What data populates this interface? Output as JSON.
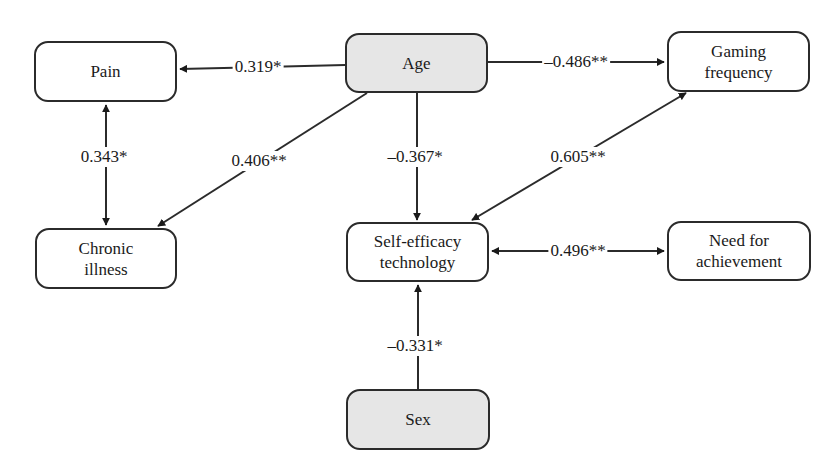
{
  "diagram": {
    "type": "path-diagram",
    "nodes": [
      {
        "id": "pain",
        "label": "Pain",
        "lines": [
          "Pain"
        ],
        "shaded": false
      },
      {
        "id": "age",
        "label": "Age",
        "lines": [
          "Age"
        ],
        "shaded": true
      },
      {
        "id": "gaming",
        "label": "Gaming frequency",
        "lines": [
          "Gaming",
          "frequency"
        ],
        "shaded": false
      },
      {
        "id": "chronic",
        "label": "Chronic illness",
        "lines": [
          "Chronic",
          "illness"
        ],
        "shaded": false
      },
      {
        "id": "selfeff",
        "label": "Self-efficacy technology",
        "lines": [
          "Self-efficacy",
          "technology"
        ],
        "shaded": false
      },
      {
        "id": "need",
        "label": "Need for achievement",
        "lines": [
          "Need for",
          "achievement"
        ],
        "shaded": false
      },
      {
        "id": "sex",
        "label": "Sex",
        "lines": [
          "Sex"
        ],
        "shaded": true
      }
    ],
    "edges": [
      {
        "from": "age",
        "to": "pain",
        "label": "0.319*",
        "directed": true
      },
      {
        "from": "age",
        "to": "gaming",
        "label": "–0.486**",
        "directed": true
      },
      {
        "from": "pain",
        "to": "chronic",
        "label": "0.343*",
        "bidirectional": true
      },
      {
        "from": "age",
        "to": "chronic",
        "label": "0.406**",
        "directed": true
      },
      {
        "from": "age",
        "to": "selfeff",
        "label": "–0.367*",
        "directed": true
      },
      {
        "from": "gaming",
        "to": "selfeff",
        "label": "0.605**",
        "bidirectional": true
      },
      {
        "from": "selfeff",
        "to": "need",
        "label": "0.496**",
        "bidirectional": true
      },
      {
        "from": "sex",
        "to": "selfeff",
        "label": "–0.331*",
        "directed": true
      }
    ]
  }
}
